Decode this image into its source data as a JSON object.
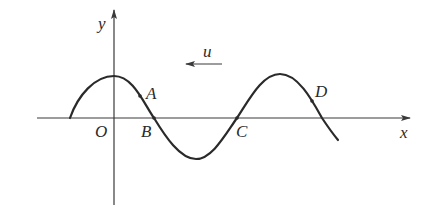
{
  "figure": {
    "type": "transverse-wave-snapshot",
    "axes": {
      "x_label": "x",
      "y_label": "y",
      "origin_label": "O"
    },
    "wave": {
      "velocity_label": "u",
      "velocity_direction": "left"
    },
    "points": [
      {
        "id": "A",
        "label": "A",
        "position": "on descending slope between crest and B"
      },
      {
        "id": "B",
        "label": "B",
        "position": "on x-axis (equilibrium)"
      },
      {
        "id": "C",
        "label": "C",
        "position": "on x-axis (equilibrium)"
      },
      {
        "id": "D",
        "label": "D",
        "position": "on descending slope after second crest"
      }
    ],
    "colors": {
      "line": "#2a2a2a",
      "axis": "#3a3a3a",
      "background": "#ffffff"
    }
  }
}
